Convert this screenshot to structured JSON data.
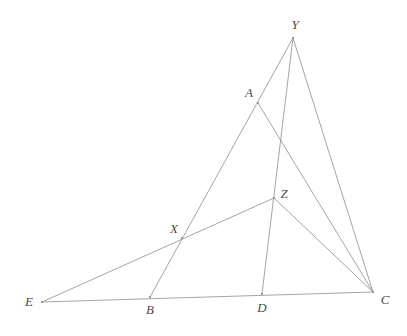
{
  "figure": {
    "background_color": "#ffffff",
    "stroke_color": "#9a9a9a",
    "label_color": "#4a4a4a",
    "width": 407,
    "height": 336
  },
  "points": [
    {
      "id": "Y",
      "label": "Y",
      "x": 293,
      "y": 38,
      "label_x": 295,
      "label_y": 24,
      "kind": "apex"
    },
    {
      "id": "A",
      "label": "A",
      "x": 258,
      "y": 103,
      "label_x": 249,
      "label_y": 92,
      "kind": "intersection"
    },
    {
      "id": "Z",
      "label": "Z",
      "x": 274,
      "y": 198,
      "label_x": 284,
      "label_y": 193,
      "kind": "intersection"
    },
    {
      "id": "X",
      "label": "X",
      "x": 182,
      "y": 238,
      "label_x": 174,
      "label_y": 228,
      "kind": "intersection"
    },
    {
      "id": "E",
      "label": "E",
      "x": 42,
      "y": 302,
      "label_x": 29,
      "label_y": 301,
      "kind": "vertex"
    },
    {
      "id": "B",
      "label": "B",
      "x": 150,
      "y": 297,
      "label_x": 150,
      "label_y": 309,
      "kind": "on-base"
    },
    {
      "id": "D",
      "label": "D",
      "x": 262,
      "y": 294,
      "label_x": 262,
      "label_y": 307,
      "kind": "on-base"
    },
    {
      "id": "C",
      "label": "C",
      "x": 373,
      "y": 292,
      "label_x": 385,
      "label_y": 299,
      "kind": "vertex"
    }
  ],
  "segments": [
    {
      "id": "E-C",
      "from": "E",
      "to": "C",
      "name": "base-line-ec"
    },
    {
      "id": "Y-B",
      "from": "Y",
      "to": "B",
      "name": "cevian-yb"
    },
    {
      "id": "Y-D",
      "from": "Y",
      "to": "D",
      "name": "cevian-yd"
    },
    {
      "id": "Y-C",
      "from": "Y",
      "to": "C",
      "name": "side-yc"
    },
    {
      "id": "A-C",
      "from": "A",
      "to": "C",
      "name": "segment-ac"
    },
    {
      "id": "E-Z",
      "from": "E",
      "to": "Z",
      "name": "segment-ez"
    },
    {
      "id": "Z-C",
      "from": "Z",
      "to": "C",
      "name": "segment-zc"
    }
  ]
}
